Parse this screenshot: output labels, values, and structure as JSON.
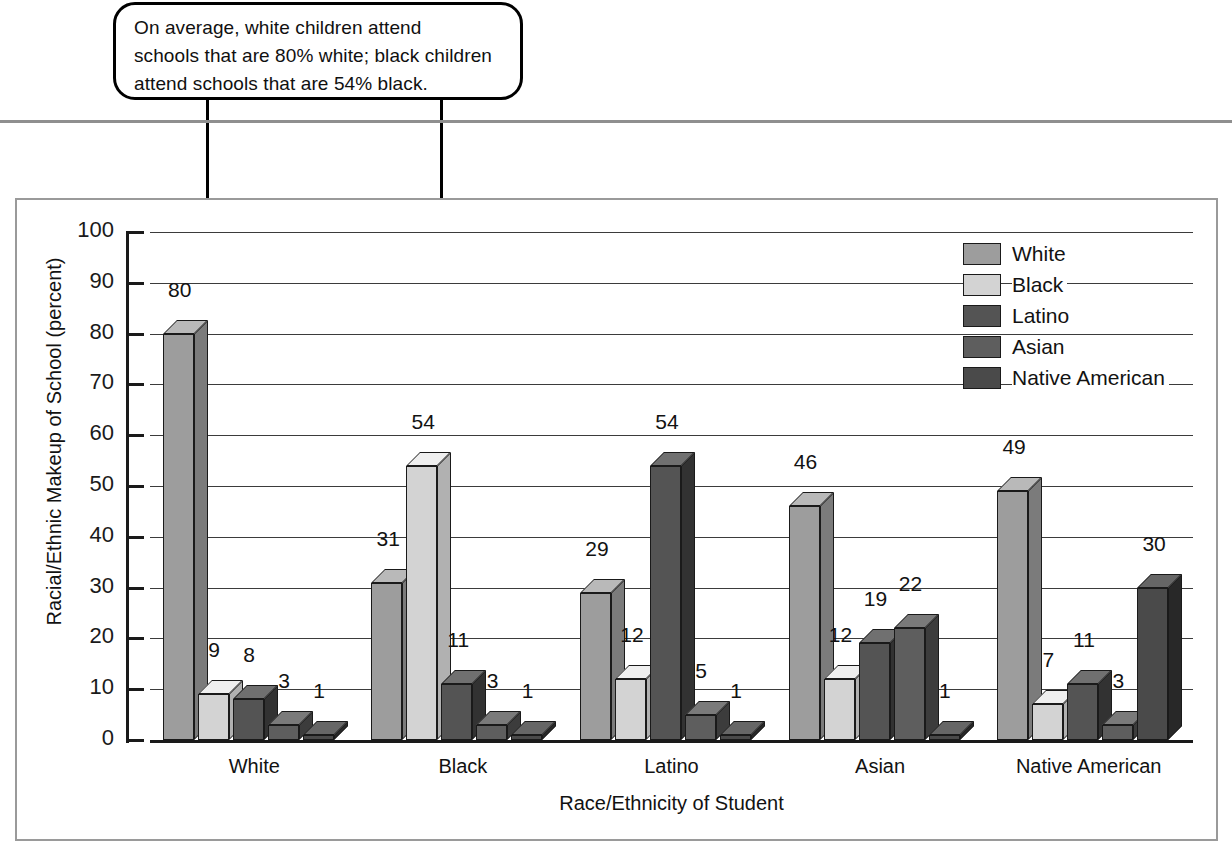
{
  "callout": {
    "lines": [
      "On average, white children attend",
      "schools that are 80% white; black children",
      "attend schools that are 54% black."
    ]
  },
  "chart_data": {
    "type": "bar",
    "title": "",
    "xlabel": "Race/Ethnicity of Student",
    "ylabel": "Racial/Ethnic Makeup of School (percent)",
    "ylim": [
      0,
      100
    ],
    "ytick_step": 10,
    "yticks": [
      "100",
      "90",
      "80",
      "70",
      "60",
      "50",
      "40",
      "30",
      "20",
      "10",
      "0"
    ],
    "grid": true,
    "legend_position": "top-right",
    "categories": [
      "White",
      "Black",
      "Latino",
      "Asian",
      "Native American"
    ],
    "series": [
      {
        "name": "White",
        "color": "#9d9d9d",
        "values": [
          80,
          31,
          29,
          46,
          49
        ]
      },
      {
        "name": "Black",
        "color": "#d3d3d3",
        "values": [
          9,
          54,
          12,
          12,
          7
        ]
      },
      {
        "name": "Latino",
        "color": "#545454",
        "values": [
          8,
          11,
          54,
          19,
          11
        ]
      },
      {
        "name": "Asian",
        "color": "#5e5e5e",
        "values": [
          3,
          3,
          5,
          22,
          3
        ]
      },
      {
        "name": "Native American",
        "color": "#4a4a4a",
        "values": [
          1,
          1,
          1,
          1,
          30
        ]
      }
    ],
    "annotations": [
      {
        "label": "arrow-to-white-white-bar",
        "target_category": "White",
        "target_series": "White",
        "target_value": 80
      },
      {
        "label": "arrow-to-black-black-bar",
        "target_category": "Black",
        "target_series": "Black",
        "target_value": 54
      }
    ]
  }
}
